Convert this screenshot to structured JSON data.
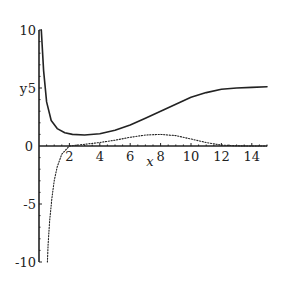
{
  "chart_data": {
    "type": "line",
    "title": "",
    "xlabel": "x",
    "ylabel": "y",
    "xlim": [
      0,
      15
    ],
    "ylim": [
      -10,
      10
    ],
    "grid": false,
    "legend": null,
    "x_ticks": [
      "2",
      "4",
      "6",
      "8",
      "10",
      "12",
      "14"
    ],
    "x_tick_values": [
      2,
      4,
      6,
      8,
      10,
      12,
      14
    ],
    "y_ticks": [
      "10",
      "5",
      "0",
      "-5",
      "-10"
    ],
    "y_tick_values": [
      10,
      5,
      0,
      -5,
      -10
    ],
    "origin_label": "0",
    "series": [
      {
        "name": "solid curve",
        "style": "solid",
        "x": [
          0.15,
          0.3,
          0.5,
          0.8,
          1.2,
          1.7,
          2.2,
          3,
          4,
          5,
          6,
          7,
          8,
          9,
          10,
          11,
          12,
          13,
          14,
          15
        ],
        "y": [
          10,
          6.5,
          3.8,
          2.2,
          1.5,
          1.15,
          1.0,
          0.95,
          1.05,
          1.35,
          1.8,
          2.4,
          3.0,
          3.6,
          4.2,
          4.6,
          4.9,
          5.0,
          5.05,
          5.1
        ]
      },
      {
        "name": "dotted curve",
        "style": "dotted",
        "x": [
          0.55,
          0.6,
          0.7,
          0.85,
          1.0,
          1.2,
          1.5,
          2.0,
          3,
          4,
          5,
          6,
          7,
          8,
          9,
          10,
          11,
          12,
          13,
          14,
          15
        ],
        "y": [
          -10,
          -8.5,
          -6.5,
          -4.5,
          -3.0,
          -1.8,
          -0.7,
          0.0,
          0.15,
          0.3,
          0.5,
          0.75,
          0.95,
          1.0,
          0.9,
          0.6,
          0.3,
          0.08,
          0.02,
          0.0,
          0.0
        ]
      }
    ]
  }
}
